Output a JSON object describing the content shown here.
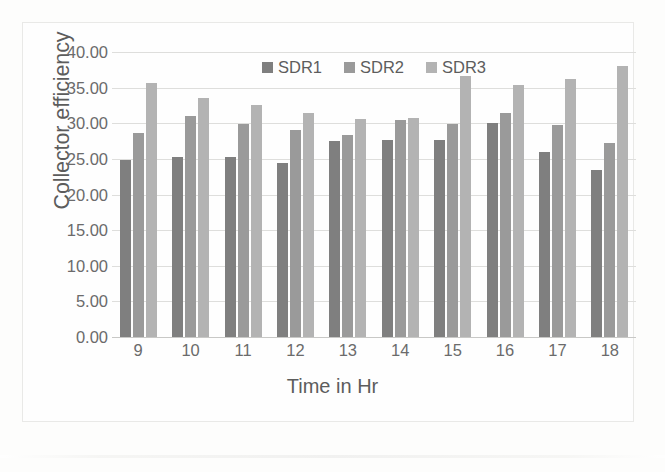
{
  "chart_data": {
    "type": "bar",
    "title": "",
    "xlabel": "Time in Hr",
    "ylabel": "Collector efficiency",
    "categories": [
      "9",
      "10",
      "11",
      "12",
      "13",
      "14",
      "15",
      "16",
      "17",
      "18"
    ],
    "ylim": [
      0,
      40
    ],
    "ytick_labels": [
      "40.00",
      "35.00",
      "30.00",
      "25.00",
      "20.00",
      "15.00",
      "10.00",
      "5.00",
      "0.00"
    ],
    "ytick_values": [
      40,
      35,
      30,
      25,
      20,
      15,
      10,
      5,
      0
    ],
    "ytick_step": 5,
    "grid": true,
    "legend_position": "top-center",
    "series": [
      {
        "name": "SDR1",
        "color": "#7f7f7f",
        "values": [
          24.8,
          25.2,
          25.3,
          24.4,
          27.5,
          27.6,
          27.7,
          30.1,
          25.9,
          23.4
        ]
      },
      {
        "name": "SDR2",
        "color": "#9a9a9a",
        "values": [
          28.6,
          31.0,
          29.9,
          29.1,
          28.3,
          30.5,
          29.9,
          31.5,
          29.7,
          27.2
        ]
      },
      {
        "name": "SDR3",
        "color": "#b3b3b3",
        "values": [
          35.7,
          33.5,
          32.5,
          31.5,
          30.6,
          30.7,
          36.6,
          35.4,
          36.2,
          38.1
        ]
      }
    ]
  }
}
